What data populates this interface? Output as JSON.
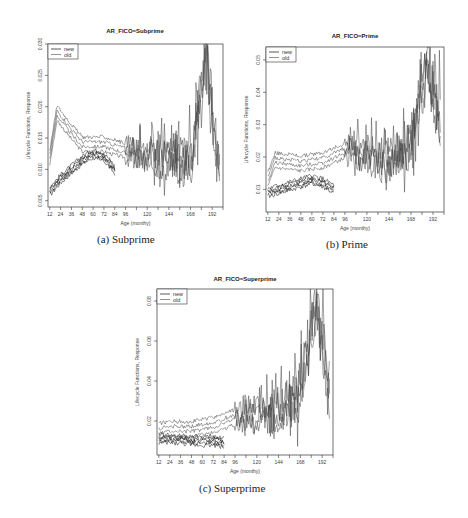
{
  "figure": {
    "panels": [
      {
        "id": "a",
        "caption": "(a) Subprime"
      },
      {
        "id": "b",
        "caption": "(b) Prime"
      },
      {
        "id": "c",
        "caption": "(c) Superprime"
      }
    ]
  },
  "chart_data": [
    {
      "type": "line",
      "title": "AR_FICO=Subprime",
      "caption": "(a) Subprime",
      "xlabel": "Age (monthy)",
      "ylabel": "Lifecycle Functions, Response",
      "xticks": [
        12,
        24,
        36,
        48,
        60,
        72,
        84,
        96,
        120,
        144,
        168,
        192
      ],
      "xlim": [
        10,
        204
      ],
      "yticks": [
        "0.005",
        "0.010",
        "0.015",
        "0.020",
        "0.025",
        "0.030"
      ],
      "ylim": [
        0.004,
        0.03
      ],
      "legend": {
        "position": "top-left",
        "entries": [
          "new",
          "old"
        ]
      },
      "grid": false,
      "series": [
        {
          "name": "new",
          "description": "several bands starting ~0.006-0.008 at age 12, rising to ~0.012-0.014 by age 60-84, ending ~age 84",
          "x": [
            12,
            24,
            36,
            48,
            60,
            72,
            84
          ],
          "values": [
            0.0065,
            0.0085,
            0.01,
            0.0115,
            0.0125,
            0.012,
            0.01
          ]
        },
        {
          "name": "old",
          "description": "bands peaking ~0.018-0.020 at age 20, declining to ~0.014 by age 48, then volatile ~0.008-0.018 with spikes up to 0.029 near age 186",
          "x": [
            12,
            20,
            36,
            48,
            72,
            96,
            120,
            144,
            168,
            186,
            198
          ],
          "values": [
            0.012,
            0.019,
            0.016,
            0.014,
            0.014,
            0.013,
            0.012,
            0.012,
            0.011,
            0.029,
            0.011
          ]
        }
      ]
    },
    {
      "type": "line",
      "title": "AR_FICO=Prime",
      "caption": "(b) Prime",
      "xlabel": "Age (monthy)",
      "ylabel": "Lifecycle Functions, Response",
      "xticks": [
        12,
        24,
        36,
        48,
        60,
        72,
        84,
        96,
        120,
        144,
        168,
        192
      ],
      "xlim": [
        10,
        204
      ],
      "yticks": [
        "0.01",
        "0.02",
        "0.03",
        "0.04",
        "0.05"
      ],
      "ylim": [
        0.003,
        0.054
      ],
      "legend": {
        "position": "top-left",
        "entries": [
          "new",
          "old"
        ]
      },
      "grid": false,
      "series": [
        {
          "name": "new",
          "description": "bands starting ~0.009 at age 12, rising to ~0.013 by age 72-84, ending near age 84",
          "x": [
            12,
            24,
            36,
            48,
            60,
            72,
            84
          ],
          "values": [
            0.009,
            0.01,
            0.011,
            0.012,
            0.013,
            0.012,
            0.01
          ]
        },
        {
          "name": "old",
          "description": "bands ~0.015-0.020 early, gradual rise to ~0.022 by age 96, volatile afterwards with spikes up to ~0.05 near ages 186-198",
          "x": [
            12,
            20,
            48,
            72,
            96,
            120,
            144,
            168,
            186,
            198
          ],
          "values": [
            0.013,
            0.019,
            0.018,
            0.019,
            0.022,
            0.021,
            0.018,
            0.025,
            0.05,
            0.03
          ]
        }
      ]
    },
    {
      "type": "line",
      "title": "AR_FICO=Superprime",
      "caption": "(c) Superprime",
      "xlabel": "Age (monthy)",
      "ylabel": "Lifecycle Functions, Response",
      "xticks": [
        12,
        24,
        36,
        48,
        60,
        72,
        84,
        96,
        120,
        144,
        168,
        192
      ],
      "xlim": [
        10,
        204
      ],
      "yticks": [
        "0.02",
        "0.04",
        "0.06",
        "0.08"
      ],
      "ylim": [
        0.003,
        0.086
      ],
      "legend": {
        "position": "top-left",
        "entries": [
          "new",
          "old"
        ]
      },
      "grid": false,
      "series": [
        {
          "name": "new",
          "description": "bands flat around ~0.010-0.012 from age 12 to ~84",
          "x": [
            12,
            24,
            36,
            48,
            60,
            72,
            84
          ],
          "values": [
            0.011,
            0.011,
            0.011,
            0.01,
            0.01,
            0.01,
            0.009
          ]
        },
        {
          "name": "old",
          "description": "bands ~0.013-0.018 early, rising slowly to ~0.025 by age 120-168, volatile with spikes up to ~0.08 near ages 186-198",
          "x": [
            12,
            24,
            48,
            72,
            96,
            120,
            144,
            168,
            186,
            198
          ],
          "values": [
            0.015,
            0.016,
            0.016,
            0.018,
            0.022,
            0.024,
            0.025,
            0.035,
            0.08,
            0.04
          ]
        }
      ]
    }
  ]
}
